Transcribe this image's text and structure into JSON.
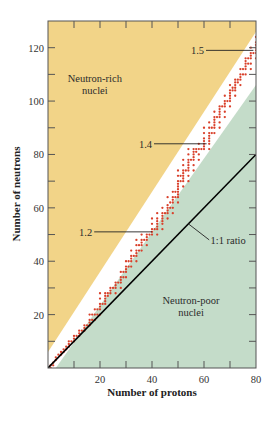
{
  "chart_data": {
    "type": "scatter",
    "title": "",
    "xlabel": "Number of protons",
    "ylabel": "Number of neutrons",
    "xlim": [
      0,
      80
    ],
    "ylim": [
      0,
      130
    ],
    "x_ticks": [
      20,
      40,
      60,
      80
    ],
    "y_ticks": [
      20,
      40,
      60,
      80,
      100,
      120
    ],
    "x_minor_ticks": [
      10,
      30,
      50,
      70
    ],
    "y_minor_ticks": [
      10,
      30,
      50,
      70,
      90,
      110
    ],
    "grid": false,
    "regions": [
      {
        "name": "Neutron-rich nuclei",
        "color": "#f2d488",
        "position": "upper-left"
      },
      {
        "name": "Band of stability",
        "color": "#ffffff",
        "position": "diagonal"
      },
      {
        "name": "Neutron-poor nuclei",
        "color": "#c4dcc9",
        "position": "lower-right"
      }
    ],
    "region_labels": [
      {
        "text_lines": [
          "Neutron-rich",
          "nuclei"
        ],
        "x": 18,
        "y": 107
      },
      {
        "text_lines": [
          "Neutron-poor",
          "nuclei"
        ],
        "x": 55,
        "y": 24
      }
    ],
    "reference_line": {
      "label": "1:1 ratio",
      "slope": 1,
      "from": [
        0,
        0
      ],
      "to": [
        80,
        80
      ],
      "color": "#000000"
    },
    "ratio_annotations": [
      {
        "label": "1.2",
        "label_at": [
          17,
          51
        ],
        "points_to": [
          40,
          51
        ]
      },
      {
        "label": "1.4",
        "label_at": [
          40,
          84
        ],
        "points_to": [
          61,
          84
        ]
      },
      {
        "label": "1.5",
        "label_at": [
          60,
          119
        ],
        "points_to": [
          79,
          119
        ]
      }
    ],
    "series": [
      {
        "name": "Stable nuclei",
        "color": "#d9402b",
        "points": [
          [
            1,
            0
          ],
          [
            1,
            1
          ],
          [
            2,
            1
          ],
          [
            2,
            2
          ],
          [
            3,
            3
          ],
          [
            3,
            4
          ],
          [
            4,
            5
          ],
          [
            5,
            5
          ],
          [
            5,
            6
          ],
          [
            6,
            6
          ],
          [
            6,
            7
          ],
          [
            7,
            7
          ],
          [
            7,
            8
          ],
          [
            8,
            8
          ],
          [
            8,
            9
          ],
          [
            8,
            10
          ],
          [
            9,
            10
          ],
          [
            10,
            10
          ],
          [
            10,
            11
          ],
          [
            10,
            12
          ],
          [
            11,
            12
          ],
          [
            12,
            12
          ],
          [
            12,
            13
          ],
          [
            12,
            14
          ],
          [
            13,
            14
          ],
          [
            14,
            14
          ],
          [
            14,
            15
          ],
          [
            14,
            16
          ],
          [
            15,
            16
          ],
          [
            16,
            16
          ],
          [
            16,
            17
          ],
          [
            16,
            18
          ],
          [
            16,
            20
          ],
          [
            17,
            18
          ],
          [
            17,
            20
          ],
          [
            18,
            18
          ],
          [
            18,
            20
          ],
          [
            18,
            22
          ],
          [
            19,
            20
          ],
          [
            19,
            22
          ],
          [
            20,
            20
          ],
          [
            20,
            22
          ],
          [
            20,
            23
          ],
          [
            20,
            24
          ],
          [
            20,
            26
          ],
          [
            20,
            28
          ],
          [
            21,
            24
          ],
          [
            22,
            24
          ],
          [
            22,
            25
          ],
          [
            22,
            26
          ],
          [
            22,
            27
          ],
          [
            22,
            28
          ],
          [
            23,
            27
          ],
          [
            23,
            28
          ],
          [
            24,
            28
          ],
          [
            24,
            29
          ],
          [
            24,
            30
          ],
          [
            25,
            30
          ],
          [
            26,
            28
          ],
          [
            26,
            30
          ],
          [
            26,
            31
          ],
          [
            26,
            32
          ],
          [
            27,
            32
          ],
          [
            28,
            30
          ],
          [
            28,
            32
          ],
          [
            28,
            33
          ],
          [
            28,
            34
          ],
          [
            28,
            36
          ],
          [
            29,
            34
          ],
          [
            29,
            36
          ],
          [
            30,
            34
          ],
          [
            30,
            36
          ],
          [
            30,
            37
          ],
          [
            30,
            38
          ],
          [
            30,
            40
          ],
          [
            31,
            38
          ],
          [
            31,
            40
          ],
          [
            32,
            38
          ],
          [
            32,
            40
          ],
          [
            32,
            41
          ],
          [
            32,
            42
          ],
          [
            32,
            44
          ],
          [
            33,
            42
          ],
          [
            34,
            40
          ],
          [
            34,
            42
          ],
          [
            34,
            43
          ],
          [
            34,
            44
          ],
          [
            34,
            46
          ],
          [
            34,
            48
          ],
          [
            35,
            44
          ],
          [
            35,
            46
          ],
          [
            36,
            44
          ],
          [
            36,
            46
          ],
          [
            36,
            47
          ],
          [
            36,
            48
          ],
          [
            36,
            50
          ],
          [
            37,
            48
          ],
          [
            38,
            46
          ],
          [
            38,
            48
          ],
          [
            38,
            49
          ],
          [
            38,
            50
          ],
          [
            39,
            50
          ],
          [
            40,
            50
          ],
          [
            40,
            51
          ],
          [
            40,
            52
          ],
          [
            40,
            54
          ],
          [
            40,
            56
          ],
          [
            41,
            52
          ],
          [
            42,
            50
          ],
          [
            42,
            52
          ],
          [
            42,
            53
          ],
          [
            42,
            54
          ],
          [
            42,
            55
          ],
          [
            42,
            56
          ],
          [
            42,
            58
          ],
          [
            44,
            52
          ],
          [
            44,
            54
          ],
          [
            44,
            55
          ],
          [
            44,
            56
          ],
          [
            44,
            57
          ],
          [
            44,
            58
          ],
          [
            44,
            60
          ],
          [
            45,
            58
          ],
          [
            46,
            56
          ],
          [
            46,
            58
          ],
          [
            46,
            59
          ],
          [
            46,
            60
          ],
          [
            46,
            61
          ],
          [
            46,
            64
          ],
          [
            47,
            60
          ],
          [
            47,
            62
          ],
          [
            48,
            58
          ],
          [
            48,
            60
          ],
          [
            48,
            62
          ],
          [
            48,
            63
          ],
          [
            48,
            64
          ],
          [
            48,
            66
          ],
          [
            49,
            64
          ],
          [
            49,
            66
          ],
          [
            50,
            62
          ],
          [
            50,
            64
          ],
          [
            50,
            65
          ],
          [
            50,
            66
          ],
          [
            50,
            67
          ],
          [
            50,
            68
          ],
          [
            50,
            69
          ],
          [
            50,
            70
          ],
          [
            50,
            72
          ],
          [
            50,
            74
          ],
          [
            51,
            70
          ],
          [
            51,
            72
          ],
          [
            52,
            68
          ],
          [
            52,
            70
          ],
          [
            52,
            71
          ],
          [
            52,
            72
          ],
          [
            52,
            73
          ],
          [
            52,
            74
          ],
          [
            52,
            76
          ],
          [
            52,
            78
          ],
          [
            53,
            74
          ],
          [
            54,
            70
          ],
          [
            54,
            72
          ],
          [
            54,
            74
          ],
          [
            54,
            75
          ],
          [
            54,
            76
          ],
          [
            54,
            77
          ],
          [
            54,
            78
          ],
          [
            54,
            80
          ],
          [
            54,
            82
          ],
          [
            55,
            78
          ],
          [
            56,
            74
          ],
          [
            56,
            76
          ],
          [
            56,
            78
          ],
          [
            56,
            79
          ],
          [
            56,
            80
          ],
          [
            56,
            81
          ],
          [
            56,
            82
          ],
          [
            57,
            81
          ],
          [
            57,
            82
          ],
          [
            58,
            78
          ],
          [
            58,
            80
          ],
          [
            58,
            82
          ],
          [
            58,
            84
          ],
          [
            59,
            82
          ],
          [
            60,
            82
          ],
          [
            60,
            83
          ],
          [
            60,
            84
          ],
          [
            60,
            85
          ],
          [
            60,
            86
          ],
          [
            60,
            88
          ],
          [
            60,
            90
          ],
          [
            62,
            82
          ],
          [
            62,
            84
          ],
          [
            62,
            85
          ],
          [
            62,
            86
          ],
          [
            62,
            87
          ],
          [
            62,
            88
          ],
          [
            62,
            90
          ],
          [
            62,
            92
          ],
          [
            63,
            88
          ],
          [
            63,
            90
          ],
          [
            64,
            88
          ],
          [
            64,
            90
          ],
          [
            64,
            91
          ],
          [
            64,
            92
          ],
          [
            64,
            93
          ],
          [
            64,
            94
          ],
          [
            64,
            96
          ],
          [
            65,
            94
          ],
          [
            66,
            90
          ],
          [
            66,
            92
          ],
          [
            66,
            94
          ],
          [
            66,
            95
          ],
          [
            66,
            96
          ],
          [
            66,
            97
          ],
          [
            66,
            98
          ],
          [
            67,
            98
          ],
          [
            68,
            94
          ],
          [
            68,
            96
          ],
          [
            68,
            98
          ],
          [
            68,
            99
          ],
          [
            68,
            100
          ],
          [
            68,
            102
          ],
          [
            69,
            100
          ],
          [
            70,
            98
          ],
          [
            70,
            100
          ],
          [
            70,
            101
          ],
          [
            70,
            102
          ],
          [
            70,
            103
          ],
          [
            70,
            104
          ],
          [
            70,
            106
          ],
          [
            71,
            104
          ],
          [
            71,
            105
          ],
          [
            72,
            102
          ],
          [
            72,
            104
          ],
          [
            72,
            105
          ],
          [
            72,
            106
          ],
          [
            72,
            107
          ],
          [
            72,
            108
          ],
          [
            73,
            107
          ],
          [
            73,
            108
          ],
          [
            74,
            106
          ],
          [
            74,
            108
          ],
          [
            74,
            109
          ],
          [
            74,
            110
          ],
          [
            74,
            112
          ],
          [
            75,
            110
          ],
          [
            75,
            112
          ],
          [
            76,
            110
          ],
          [
            76,
            112
          ],
          [
            76,
            113
          ],
          [
            76,
            114
          ],
          [
            76,
            115
          ],
          [
            76,
            116
          ],
          [
            77,
            114
          ],
          [
            77,
            116
          ],
          [
            78,
            112
          ],
          [
            78,
            114
          ],
          [
            78,
            116
          ],
          [
            78,
            117
          ],
          [
            78,
            118
          ],
          [
            78,
            120
          ],
          [
            79,
            118
          ],
          [
            80,
            116
          ],
          [
            80,
            118
          ],
          [
            80,
            119
          ],
          [
            80,
            120
          ],
          [
            80,
            121
          ],
          [
            80,
            122
          ],
          [
            80,
            124
          ]
        ]
      }
    ],
    "band_boundaries": {
      "upper_edge": [
        [
          0,
          6
        ],
        [
          80,
          126
        ]
      ],
      "lower_edge": [
        [
          3,
          0
        ],
        [
          80,
          106
        ]
      ]
    }
  }
}
